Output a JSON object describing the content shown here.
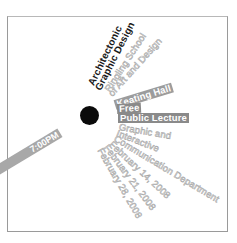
{
  "poster": {
    "title_lines": [
      "Architectonic",
      "Graphic Design"
    ],
    "school_lines": [
      "Ringling School",
      "of Art and Design"
    ],
    "venue": "Keating Hall",
    "price": "Free",
    "event_type": "Public Lecture",
    "department_lines": [
      "Graphic and",
      "Interactive",
      "Communication Department"
    ],
    "dates": [
      "February 14, 2008",
      "February 21, 2008",
      "February 28, 2008"
    ],
    "time": "7:00PM"
  },
  "colors": {
    "dot": "#0a0a0a",
    "bar_gray": "#9c9c9c",
    "outline_gray": "#a8a8a8",
    "title_black": "#1a1a1a"
  }
}
